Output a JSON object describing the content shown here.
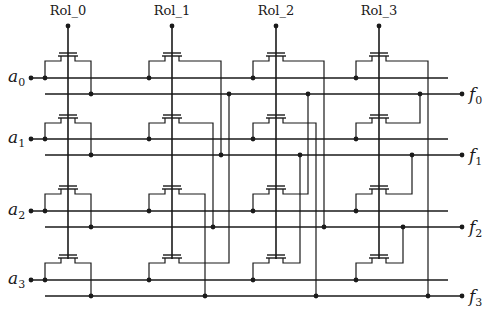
{
  "diagram": {
    "type": "crossbar circuit (transistor switch matrix)",
    "columns": [
      {
        "label": "Rol_0",
        "x": 68
      },
      {
        "label": "Rol_1",
        "x": 172
      },
      {
        "label": "Rol_2",
        "x": 276
      },
      {
        "label": "Rol_3",
        "x": 379
      }
    ],
    "inputs": [
      {
        "name": "a",
        "sub": "0",
        "y": 78
      },
      {
        "name": "a",
        "sub": "1",
        "y": 139
      },
      {
        "name": "a",
        "sub": "2",
        "y": 211
      },
      {
        "name": "a",
        "sub": "3",
        "y": 280
      }
    ],
    "outputs": [
      {
        "name": "f",
        "sub": "0",
        "y": 94
      },
      {
        "name": "f",
        "sub": "1",
        "y": 155
      },
      {
        "name": "f",
        "sub": "2",
        "y": 227
      },
      {
        "name": "f",
        "sub": "3",
        "y": 296
      }
    ],
    "connections": [
      {
        "column": "Rol_0",
        "map": [
          "a0->f0",
          "a1->f1",
          "a2->f2",
          "a3->f3"
        ]
      },
      {
        "column": "Rol_1",
        "map": [
          "a0->f1",
          "a1->f2",
          "a2->f3",
          "a3->f0"
        ]
      },
      {
        "column": "Rol_2",
        "map": [
          "a0->f2",
          "a1->f3",
          "a2->f0",
          "a3->f1"
        ]
      },
      {
        "column": "Rol_3",
        "map": [
          "a0->f3",
          "a1->f0",
          "a2->f1",
          "a3->f2"
        ]
      }
    ],
    "colors": {
      "line": "#1a1a1a",
      "background": "#ffffff"
    }
  }
}
